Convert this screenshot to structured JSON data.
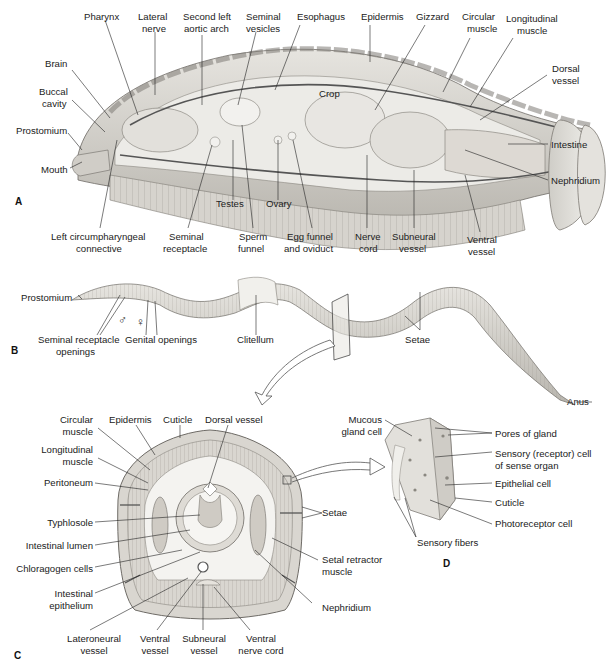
{
  "figure": {
    "panels": [
      {
        "id": "A",
        "letter": "A",
        "description": "Longitudinal cutaway of earthworm anterior",
        "labels": {
          "pharynx": "Pharynx",
          "lateral_nerve_1": "Lateral",
          "lateral_nerve_2": "nerve",
          "aortic_1": "Second left",
          "aortic_2": "aortic arch",
          "seminal_vesicles_1": "Seminal",
          "seminal_vesicles_2": "vesicles",
          "esophagus": "Esophagus",
          "epidermis": "Epidermis",
          "gizzard": "Gizzard",
          "circular_1": "Circular",
          "circular_2": "muscle",
          "longitudinal_1": "Longitudinal",
          "longitudinal_2": "muscle",
          "brain": "Brain",
          "buccal_1": "Buccal",
          "buccal_2": "cavity",
          "dorsal_1": "Dorsal",
          "dorsal_2": "vessel",
          "crop": "Crop",
          "prostomium": "Prostomium",
          "intestine": "Intestine",
          "mouth": "Mouth",
          "nephridium": "Nephridium",
          "testes": "Testes",
          "ovary": "Ovary",
          "circumpharyngeal_1": "Left circumpharyngeal",
          "circumpharyngeal_2": "connective",
          "seminal_receptacle_1": "Seminal",
          "seminal_receptacle_2": "receptacle",
          "sperm_funnel_1": "Sperm",
          "sperm_funnel_2": "funnel",
          "egg_funnel_1": "Egg funnel",
          "egg_funnel_2": "and oviduct",
          "nerve_cord_1": "Nerve",
          "nerve_cord_2": "cord",
          "subneural_1": "Subneural",
          "subneural_2": "vessel",
          "ventral_1": "Ventral",
          "ventral_2": "vessel"
        }
      },
      {
        "id": "B",
        "letter": "B",
        "description": "External view of whole earthworm",
        "labels": {
          "prostomium": "Prostomium",
          "seminal_openings_1": "Seminal receptacle",
          "seminal_openings_2": "openings",
          "male_symbol": "♂",
          "female_symbol": "♀",
          "genital_openings": "Genital openings",
          "clitellum": "Clitellum",
          "setae": "Setae",
          "anus": "Anus"
        }
      },
      {
        "id": "C",
        "letter": "C",
        "description": "Cross section of earthworm body",
        "labels": {
          "circular_1": "Circular",
          "circular_2": "muscle",
          "epidermis": "Epidermis",
          "cuticle": "Cuticle",
          "dorsal_vessel": "Dorsal vessel",
          "longitudinal_1": "Longitudinal",
          "longitudinal_2": "muscle",
          "peritoneum": "Peritoneum",
          "typhlosole": "Typhlosole",
          "setae": "Setae",
          "intestinal_lumen": "Intestinal lumen",
          "chloragogen": "Chloragogen cells",
          "setal_retractor_1": "Setal retractor",
          "setal_retractor_2": "muscle",
          "intestinal_epi_1": "Intestinal",
          "intestinal_epi_2": "epithelium",
          "nephridium": "Nephridium",
          "lateroneural_1": "Lateroneural",
          "lateroneural_2": "vessel",
          "ventral_vessel_1": "Ventral",
          "ventral_vessel_2": "vessel",
          "subneural_1": "Subneural",
          "subneural_2": "vessel",
          "ventral_nerve_1": "Ventral",
          "ventral_nerve_2": "nerve cord"
        }
      },
      {
        "id": "D",
        "letter": "D",
        "description": "Enlarged epidermis detail",
        "labels": {
          "mucous_1": "Mucous",
          "mucous_2": "gland cell",
          "pores": "Pores of gland",
          "sensory_cell_1": "Sensory (receptor) cell",
          "sensory_cell_2": "of sense organ",
          "epithelial": "Epithelial cell",
          "cuticle": "Cuticle",
          "photoreceptor": "Photoreceptor cell",
          "sensory_fibers": "Sensory fibers"
        }
      }
    ],
    "colors": {
      "body": "#d9d7d2",
      "body_shade": "#b9b6b0",
      "outline": "#6e6b66",
      "clitellum": "#efefea",
      "leader": "#222222"
    }
  }
}
